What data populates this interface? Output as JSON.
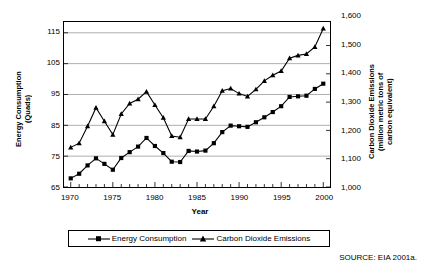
{
  "chart_data": {
    "type": "line",
    "title": "",
    "xlabel": "Year",
    "x": [
      1970,
      1971,
      1972,
      1973,
      1974,
      1975,
      1976,
      1977,
      1978,
      1979,
      1980,
      1981,
      1982,
      1983,
      1984,
      1985,
      1986,
      1987,
      1988,
      1989,
      1990,
      1991,
      1992,
      1993,
      1994,
      1995,
      1996,
      1997,
      1998,
      1999,
      2000
    ],
    "xlim": [
      1969.2,
      2000.8
    ],
    "xticks": [
      1970,
      1975,
      1980,
      1985,
      1990,
      1995,
      2000
    ],
    "xticklabels": [
      "1970",
      "1975",
      "1980",
      "1985",
      "1990",
      "1995",
      "2000"
    ],
    "grid": true,
    "legend_position": "below-plot",
    "series": [
      {
        "name": "Energy Consumption",
        "axis": "left",
        "marker": "square",
        "ylabel": "Energy Consumption (Quads)",
        "ylim": [
          65,
          118.5
        ],
        "yticks": [
          65,
          75,
          85,
          95,
          105,
          115
        ],
        "yticklabels": [
          "65",
          "75",
          "85",
          "95",
          "105",
          "115"
        ],
        "values": [
          67.8,
          69.3,
          72.0,
          74.3,
          72.5,
          70.6,
          74.4,
          76.3,
          78.1,
          80.9,
          78.3,
          76.0,
          73.2,
          73.1,
          76.7,
          76.5,
          76.8,
          79.2,
          82.8,
          84.9,
          84.7,
          84.5,
          86.0,
          87.6,
          89.3,
          91.2,
          94.2,
          94.4,
          94.6,
          96.8,
          98.5
        ]
      },
      {
        "name": "Carbon Dioxide Emissions",
        "axis": "right",
        "marker": "triangle",
        "ylabel": "Carbon Dioxide Emissions (million metric tons of carbon equivalent)",
        "ylim": [
          1000,
          1583
        ],
        "yticks": [
          1000,
          1100,
          1200,
          1300,
          1400,
          1500,
          1600
        ],
        "yticklabels": [
          "1,000",
          "1,100",
          "1,200",
          "1,300",
          "1,400",
          "1,500",
          "1,600"
        ],
        "values": [
          1140,
          1155,
          1215,
          1280,
          1232,
          1185,
          1258,
          1295,
          1310,
          1337,
          1290,
          1245,
          1180,
          1176,
          1240,
          1240,
          1240,
          1285,
          1340,
          1348,
          1330,
          1320,
          1345,
          1375,
          1395,
          1410,
          1455,
          1465,
          1470,
          1495,
          1560
        ]
      }
    ]
  },
  "axes": {
    "left_title": "Energy Consumption\n(Quads)",
    "right_title": "Carbon Dioxide Emissions\n(million metric tons of\ncarbon equivalent)",
    "x_title": "Year"
  },
  "legend": {
    "items": [
      {
        "label": "Energy Consumption",
        "marker": "square"
      },
      {
        "label": "Carbon Dioxide Emissions",
        "marker": "triangle"
      }
    ]
  },
  "source": {
    "text": "SOURCE: EIA 2001a."
  },
  "colors": {
    "series": "#000000",
    "grid": "#9a9a9a",
    "frame": "#000000",
    "background": "#ffffff"
  }
}
